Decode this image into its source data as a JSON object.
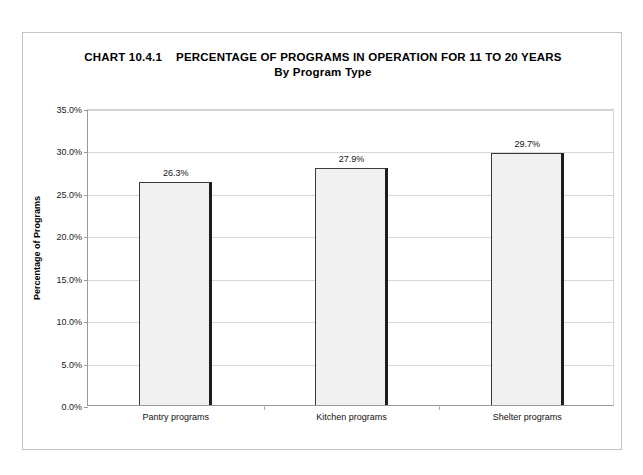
{
  "figure": {
    "title_label": "CHART 10.4.1",
    "title_main": "PERCENTAGE OF PROGRAMS IN OPERATION FOR 11 TO 20 YEARS",
    "subtitle": "By Program Type"
  },
  "chart_data": {
    "type": "bar",
    "subtitle": "By Program Type",
    "categories": [
      "Pantry programs",
      "Kitchen programs",
      "Shelter programs"
    ],
    "values": [
      26.3,
      27.9,
      29.7
    ],
    "value_labels": [
      "26.3%",
      "27.9%",
      "29.7%"
    ],
    "xlabel": "",
    "ylabel": "Percentage of Programs",
    "ylim": [
      0,
      35
    ],
    "ytick_step": 5,
    "ytick_labels": [
      "0.0%",
      "5.0%",
      "10.0%",
      "15.0%",
      "20.0%",
      "25.0%",
      "30.0%",
      "35.0%"
    ],
    "ytick_values": [
      0,
      5,
      10,
      15,
      20,
      25,
      30,
      35
    ],
    "grid": "horizontal",
    "legend": "none",
    "bar_fill_color": "#f0f0f0",
    "bar_edge_color": "#3a3a3a",
    "gridline_color": "#d6d6d6",
    "axis_color": "#9a9a9a"
  }
}
